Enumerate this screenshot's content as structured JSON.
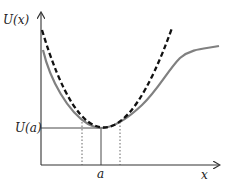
{
  "diagram": {
    "y_axis_label": "U(x)",
    "x_axis_label": "x",
    "minimum_value_label": "U(a)",
    "minimum_position_label": "a",
    "curves": [
      {
        "name": "potential-energy",
        "style": "solid",
        "color": "#808080"
      },
      {
        "name": "harmonic-approximation",
        "style": "dashed",
        "color": "#111111"
      }
    ],
    "axis_color": "#333333"
  }
}
